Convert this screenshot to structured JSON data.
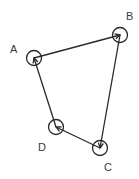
{
  "diagram": {
    "type": "graph",
    "stroke_color": "#2a2a2a",
    "label_color": "#3a3a3a",
    "nodes": [
      {
        "id": "A",
        "label": "A",
        "cx": 34,
        "cy": 58,
        "r": 7.5,
        "lx": 10,
        "ly": 53
      },
      {
        "id": "B",
        "label": "B",
        "cx": 120,
        "cy": 35,
        "r": 7.5,
        "lx": 126,
        "ly": 20
      },
      {
        "id": "C",
        "label": "C",
        "cx": 100,
        "cy": 148,
        "r": 7.5,
        "lx": 104,
        "ly": 171
      },
      {
        "id": "D",
        "label": "D",
        "cx": 56,
        "cy": 127,
        "r": 7.5,
        "lx": 38,
        "ly": 151
      }
    ],
    "edges": [
      {
        "from": "A",
        "to": "B"
      },
      {
        "from": "B",
        "to": "C"
      },
      {
        "from": "C",
        "to": "D"
      },
      {
        "from": "D",
        "to": "A"
      }
    ]
  }
}
